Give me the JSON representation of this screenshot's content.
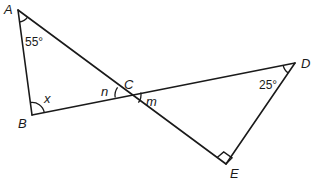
{
  "diagram": {
    "type": "geometry",
    "points": {
      "A": {
        "label": "A",
        "x": 18,
        "y": 10
      },
      "B": {
        "label": "B",
        "x": 32,
        "y": 115
      },
      "C": {
        "label": "C",
        "x": 128,
        "y": 95
      },
      "D": {
        "label": "D",
        "x": 295,
        "y": 63
      },
      "E": {
        "label": "E",
        "x": 226,
        "y": 164
      }
    },
    "segments": [
      [
        "A",
        "B"
      ],
      [
        "A",
        "E"
      ],
      [
        "B",
        "D"
      ],
      [
        "D",
        "E"
      ]
    ],
    "angles": {
      "A": {
        "value": "55°"
      },
      "B": {
        "value": "x"
      },
      "C_left": {
        "value": "n"
      },
      "C_right": {
        "value": "m"
      },
      "D": {
        "value": "25°"
      },
      "E": {
        "value": "right-angle"
      }
    }
  }
}
